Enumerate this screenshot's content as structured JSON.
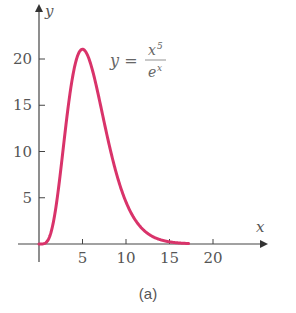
{
  "chart_data": {
    "type": "line",
    "title": "",
    "caption": "(a)",
    "xlabel": "x",
    "ylabel": "y",
    "xlim": [
      0,
      26
    ],
    "ylim": [
      0,
      25
    ],
    "xticks": [
      5,
      10,
      15,
      20
    ],
    "xtick_labels": [
      "5",
      "10",
      "15",
      "20"
    ],
    "yticks": [
      5,
      10,
      15,
      20
    ],
    "ytick_labels": [
      "5",
      "10",
      "15",
      "20"
    ],
    "grid": false,
    "legend": null,
    "annotations": [
      {
        "text": "y = x^5 / e^x",
        "position": "upper right of peak"
      }
    ],
    "series": [
      {
        "name": "y = x^5 / e^x",
        "color": "#d9336a",
        "x": [
          0,
          1,
          2,
          3,
          4,
          5,
          6,
          7,
          8,
          9,
          10,
          11,
          12,
          13,
          14,
          15,
          16,
          17.2
        ],
        "values": [
          0,
          0.37,
          4.33,
          12.1,
          18.76,
          21.06,
          19.27,
          15.32,
          11.0,
          7.29,
          4.54,
          2.69,
          1.53,
          0.84,
          0.46,
          0.23,
          0.12,
          0.05
        ]
      }
    ]
  },
  "labels": {
    "x_axis": "x",
    "y_axis": "y",
    "equation_lhs": "y =",
    "equation_num": "x",
    "equation_num_exp": "5",
    "equation_den": "e",
    "equation_den_exp": "x",
    "caption": "(a)",
    "xticks": [
      "5",
      "10",
      "15",
      "20"
    ],
    "yticks": [
      "5",
      "10",
      "15",
      "20"
    ]
  },
  "colors": {
    "curve": "#d9336a",
    "axis": "#444444",
    "text": "#555555"
  }
}
